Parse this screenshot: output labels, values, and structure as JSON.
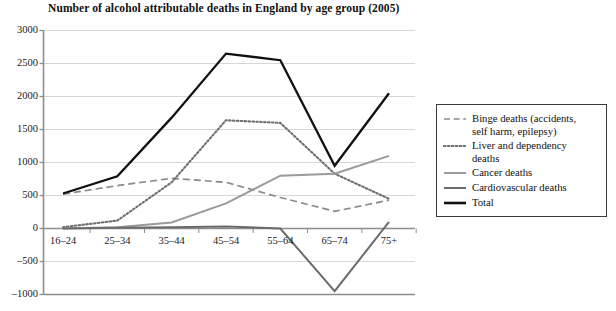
{
  "chart_data": {
    "type": "line",
    "title": "Number of alcohol attributable deaths in England by age group (2005)",
    "xlabel": "",
    "ylabel": "",
    "categories": [
      "16–24",
      "25–34",
      "35–44",
      "45–54",
      "55–64",
      "65–74",
      "75+"
    ],
    "ylim": [
      -1000,
      3000
    ],
    "yticks": [
      3000,
      2500,
      2000,
      1500,
      1000,
      500,
      0,
      -500,
      -1000
    ],
    "ytick_labels": [
      "3000",
      "2500",
      "2000",
      "1500",
      "1000",
      "500",
      "0",
      "–500",
      "–1000"
    ],
    "grid": true,
    "legend_position": "right",
    "series": [
      {
        "name": "Binge deaths (accidents, self harm, epilepsy)",
        "style": "dashed",
        "color": "#8a8a8a",
        "values": [
          520,
          650,
          760,
          700,
          470,
          260,
          430
        ]
      },
      {
        "name": "Liver and dependency deaths",
        "style": "dotted",
        "color": "#6e6e6e",
        "values": [
          20,
          120,
          700,
          1640,
          1600,
          830,
          450
        ]
      },
      {
        "name": "Cancer deaths",
        "style": "solid",
        "color": "#9a9a9a",
        "values": [
          0,
          20,
          90,
          380,
          800,
          830,
          1100
        ]
      },
      {
        "name": "Cardiovascular deaths",
        "style": "solid",
        "color": "#6b6b6b",
        "values": [
          0,
          10,
          20,
          30,
          0,
          -950,
          100
        ]
      },
      {
        "name": "Total",
        "style": "solid-bold",
        "color": "#111111",
        "values": [
          530,
          790,
          1680,
          2650,
          2550,
          950,
          2050
        ]
      }
    ]
  },
  "legend": {
    "entries": [
      {
        "label_line1": "Binge deaths (accidents,",
        "label_line2": "self harm, epilepsy)",
        "swatch": "dashed-line-icon"
      },
      {
        "label_line1": "Liver and dependency",
        "label_line2": "deaths",
        "swatch": "dotted-line-icon"
      },
      {
        "label_line1": "Cancer deaths",
        "label_line2": "",
        "swatch": "solid-line-light-icon"
      },
      {
        "label_line1": "Cardiovascular deaths",
        "label_line2": "",
        "swatch": "solid-line-medium-icon"
      },
      {
        "label_line1": "Total",
        "label_line2": "",
        "swatch": "solid-line-bold-icon"
      }
    ]
  }
}
